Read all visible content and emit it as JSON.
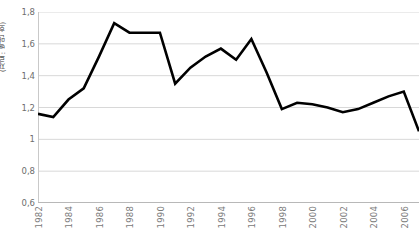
{
  "chart_data": {
    "type": "line",
    "title": "",
    "subtitle": "",
    "xlabel": "",
    "ylabel": "(자료: 백만 호)",
    "ylim": [
      0.6,
      1.8
    ],
    "ytick_values": [
      "1,8",
      "1,6",
      "1,4",
      "1,2",
      "1",
      "0,8",
      "0,6"
    ],
    "ytick_numbers": [
      1.8,
      1.6,
      1.4,
      1.2,
      1.0,
      0.8,
      0.6
    ],
    "xlim": [
      1982,
      2007
    ],
    "xtick_labels": [
      "1982",
      "1984",
      "1986",
      "1988",
      "1990",
      "1992",
      "1994",
      "1996",
      "1998",
      "2000",
      "2002",
      "2004",
      "2006"
    ],
    "xtick_values": [
      1982,
      1984,
      1986,
      1988,
      1990,
      1992,
      1994,
      1996,
      1998,
      2000,
      2002,
      2004,
      2006
    ],
    "grid": true,
    "grid_axis": "y",
    "legend": false,
    "legend_position": "none",
    "line_color": "#000000",
    "grid_color": "#d8d8d8",
    "background_color": "#ffffff",
    "series": [
      {
        "name": "series-1",
        "x": [
          1982,
          1983,
          1984,
          1985,
          1986,
          1987,
          1988,
          1989,
          1990,
          1991,
          1992,
          1993,
          1994,
          1995,
          1996,
          1997,
          1998,
          1999,
          2000,
          2001,
          2002,
          2003,
          2004,
          2005,
          2006,
          2007
        ],
        "values": [
          1.16,
          1.14,
          1.25,
          1.32,
          1.52,
          1.73,
          1.67,
          1.67,
          1.67,
          1.35,
          1.45,
          1.52,
          1.57,
          1.5,
          1.63,
          1.42,
          1.19,
          1.23,
          1.22,
          1.2,
          1.17,
          1.19,
          1.23,
          1.27,
          1.3,
          1.05
        ]
      }
    ]
  },
  "accessibility": {
    "chart_name": "line-chart"
  }
}
